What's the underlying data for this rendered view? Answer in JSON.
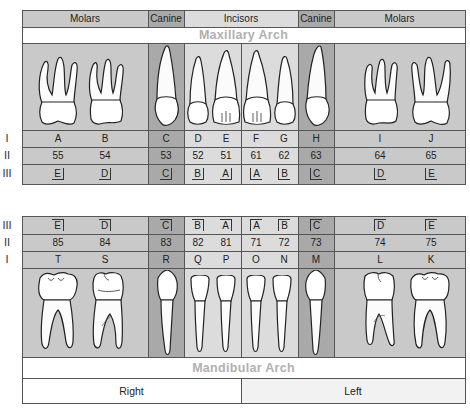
{
  "header": {
    "groups": [
      {
        "label": "Molars",
        "type": "molar"
      },
      {
        "label": "Canine",
        "type": "canine"
      },
      {
        "label": "Incisors",
        "type": "incisor"
      },
      {
        "label": "Canine",
        "type": "canine"
      },
      {
        "label": "Molars",
        "type": "molar"
      }
    ]
  },
  "maxillary": {
    "title": "Maxillary Arch",
    "row_labels": [
      "I",
      "II",
      "III"
    ],
    "letters": [
      "A",
      "B",
      "C",
      "D",
      "E",
      "F",
      "G",
      "H",
      "I",
      "J"
    ],
    "numbers": [
      "55",
      "54",
      "53",
      "52",
      "51",
      "61",
      "62",
      "63",
      "64",
      "65"
    ],
    "palmer": [
      "E",
      "D",
      "C",
      "B",
      "A",
      "A",
      "B",
      "C",
      "D",
      "E"
    ]
  },
  "mandibular": {
    "title": "Mandibular Arch",
    "row_labels": [
      "III",
      "II",
      "I"
    ],
    "palmer": [
      "E",
      "D",
      "C",
      "B",
      "A",
      "A",
      "B",
      "C",
      "D",
      "E"
    ],
    "numbers": [
      "85",
      "84",
      "83",
      "82",
      "81",
      "71",
      "72",
      "73",
      "74",
      "75"
    ],
    "letters": [
      "T",
      "S",
      "R",
      "Q",
      "P",
      "O",
      "N",
      "M",
      "L",
      "K"
    ]
  },
  "sides": {
    "right": "Right",
    "left": "Left"
  },
  "colors": {
    "molar": "#c9c9c9",
    "canine": "#a9a9a9",
    "incisor": "#dcdcdc",
    "arch_title": "#b0b0b0",
    "grid": "#555555"
  }
}
